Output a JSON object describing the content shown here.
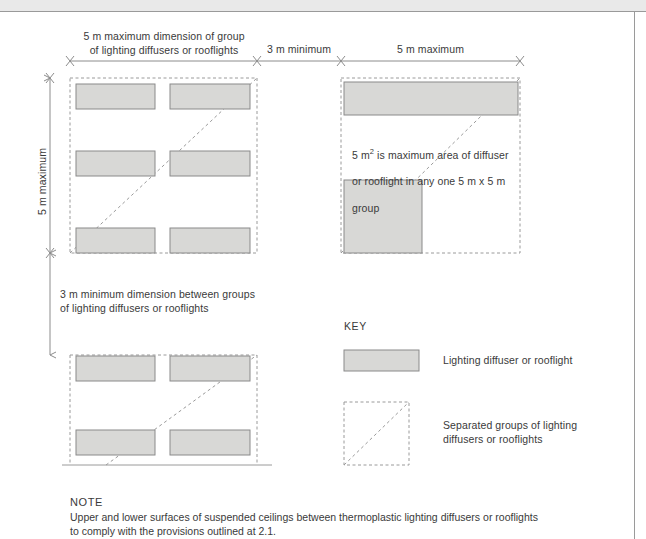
{
  "figure": {
    "title_none": "",
    "colors": {
      "diffuser_fill": "#d8d8d6",
      "diffuser_stroke": "#8a8a8a",
      "group_dash_stroke": "#9a9a9a",
      "dimension_line": "#8c8c8c",
      "text": "#3a3a3a",
      "page_rule": "#9a9a9a",
      "top_band": "#e9e9e9"
    }
  },
  "dimensions": {
    "top_left_label": "5 m maximum dimension of group\nof lighting diffusers or rooflights",
    "top_middle_label": "3 m minimum",
    "top_right_label": "5 m maximum",
    "left_vertical_label": "5 m maximum",
    "between_groups_label": "3 m minimum dimension between groups\nof lighting diffusers or rooflights"
  },
  "annotations": {
    "area_note_line1_pre": "5 m",
    "area_note_line1_sup": "2",
    "area_note_line1_post": " is maximum area of diffuser",
    "area_note_line2": "or rooflight in any one 5 m x 5 m",
    "area_note_line3": "group"
  },
  "key": {
    "heading": "KEY",
    "items": [
      {
        "swatch": "diffuser-swatch",
        "label": "Lighting diffuser or rooflight"
      },
      {
        "swatch": "group-swatch",
        "label": "Separated groups of lighting\ndiffusers or rooflights"
      }
    ]
  },
  "note": {
    "heading": "NOTE",
    "body": "Upper and lower surfaces of suspended ceilings between thermoplastic lighting diffusers or rooflights\nto comply with the provisions outlined at 2.1."
  },
  "groups": {
    "top_left": {
      "name": "group-top-left",
      "box": {
        "x": 70,
        "y": 78,
        "w": 187,
        "h": 175
      },
      "diffusers": [
        {
          "x": 76,
          "y": 84,
          "w": 79,
          "h": 25
        },
        {
          "x": 170,
          "y": 84,
          "w": 80,
          "h": 25
        },
        {
          "x": 76,
          "y": 151,
          "w": 79,
          "h": 25
        },
        {
          "x": 170,
          "y": 151,
          "w": 80,
          "h": 25
        },
        {
          "x": 76,
          "y": 228,
          "w": 79,
          "h": 25
        },
        {
          "x": 170,
          "y": 228,
          "w": 80,
          "h": 25
        }
      ]
    },
    "top_right": {
      "name": "group-top-right",
      "box": {
        "x": 341,
        "y": 78,
        "w": 179,
        "h": 175
      },
      "diffusers": [
        {
          "x": 344,
          "y": 82,
          "w": 174,
          "h": 33
        },
        {
          "x": 344,
          "y": 180,
          "w": 78,
          "h": 73
        }
      ]
    },
    "bottom_left": {
      "name": "group-bottom-left",
      "box": {
        "x": 70,
        "y": 355,
        "w": 187,
        "h": 110
      },
      "diffusers": [
        {
          "x": 76,
          "y": 356,
          "w": 79,
          "h": 25
        },
        {
          "x": 170,
          "y": 356,
          "w": 80,
          "h": 25
        },
        {
          "x": 76,
          "y": 430,
          "w": 79,
          "h": 25
        },
        {
          "x": 170,
          "y": 430,
          "w": 80,
          "h": 25
        }
      ]
    }
  }
}
